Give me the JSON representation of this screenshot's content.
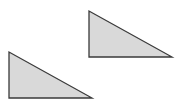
{
  "diagram": {
    "background": "#ffffff",
    "fill": "#d9d9d9",
    "stroke": "#3a3a3a",
    "shapes": [
      {
        "type": "right-triangle",
        "name": "triangle-upper-right",
        "points": "89,11 89,57 172,57"
      },
      {
        "type": "right-triangle",
        "name": "triangle-lower-left",
        "points": "9,52 9,98 92,98"
      }
    ]
  }
}
